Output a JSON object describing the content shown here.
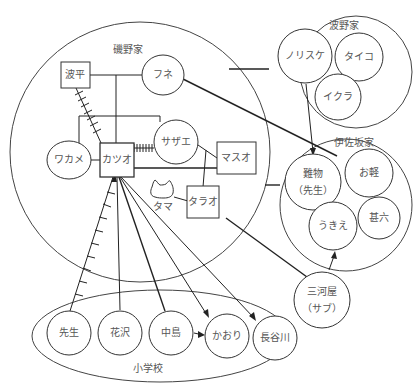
{
  "diagram": {
    "type": "relationship-map",
    "groups": {
      "isono": {
        "label": "磯野家"
      },
      "namino": {
        "label": "波野家"
      },
      "isaka": {
        "label": "伊佐坂家"
      },
      "school": {
        "label": "小学校"
      }
    },
    "nodes": {
      "namihei": {
        "label": "波平",
        "shape": "square"
      },
      "fune": {
        "label": "フネ",
        "shape": "circle"
      },
      "wakame": {
        "label": "ワカメ",
        "shape": "circle"
      },
      "katsuo": {
        "label": "カツオ",
        "shape": "square"
      },
      "sazae": {
        "label": "サザエ",
        "shape": "circle"
      },
      "masuo": {
        "label": "マスオ",
        "shape": "square"
      },
      "tarao": {
        "label": "タラオ",
        "shape": "square"
      },
      "tama": {
        "label": "タマ",
        "shape": "cat"
      },
      "norisuke": {
        "label": "ノリスケ",
        "shape": "circle"
      },
      "taiko": {
        "label": "タイコ",
        "shape": "circle"
      },
      "ikura": {
        "label": "イクラ",
        "shape": "circle"
      },
      "nanbutsu": {
        "label": "難物",
        "sub": "（先生）",
        "shape": "circle"
      },
      "okaru": {
        "label": "お軽",
        "shape": "circle"
      },
      "ukie": {
        "label": "うきえ",
        "shape": "circle"
      },
      "jinroku": {
        "label": "甚六",
        "shape": "circle"
      },
      "mikawaya": {
        "label": "三河屋",
        "sub": "（サブ）",
        "shape": "circle"
      },
      "sensei": {
        "label": "先生",
        "shape": "circle"
      },
      "hanazawa": {
        "label": "花沢",
        "shape": "circle"
      },
      "nakajima": {
        "label": "中島",
        "shape": "circle"
      },
      "kaori": {
        "label": "かおり",
        "shape": "circle"
      },
      "hasegawa": {
        "label": "長谷川",
        "shape": "circle"
      }
    }
  }
}
